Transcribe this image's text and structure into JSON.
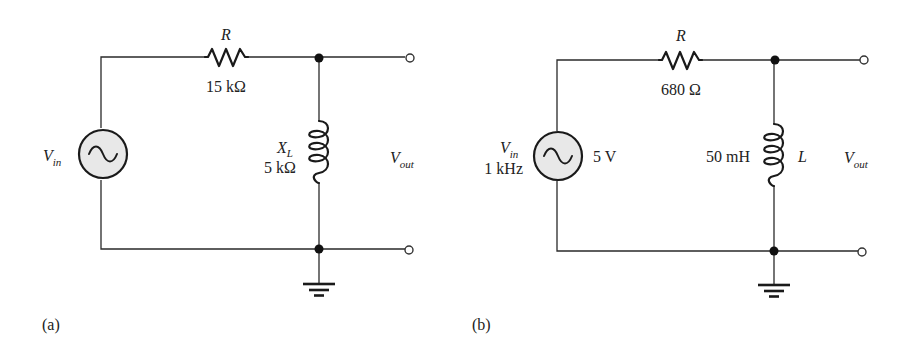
{
  "circuits": [
    {
      "id": "a",
      "caption": "(a)",
      "resistor": {
        "name": "R",
        "value": "15 kΩ"
      },
      "inductor": {
        "name": "X",
        "name_sub": "L",
        "value": "5 kΩ"
      },
      "source": {
        "name": "V",
        "name_sub": "in"
      },
      "output": {
        "name": "V",
        "name_sub": "out"
      }
    },
    {
      "id": "b",
      "caption": "(b)",
      "resistor": {
        "name": "R",
        "value": "680 Ω"
      },
      "inductor": {
        "name": "L",
        "value": "50 mH"
      },
      "source": {
        "name": "V",
        "name_sub": "in",
        "frequency": "1 kHz",
        "amplitude": "5 V"
      },
      "output": {
        "name": "V",
        "name_sub": "out"
      }
    }
  ]
}
